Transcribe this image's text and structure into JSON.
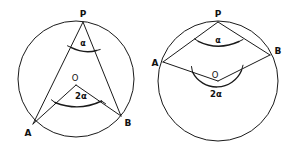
{
  "figure": {
    "background_color": "#ffffff",
    "stroke_color": "#1a1a1a",
    "width": 294,
    "height": 156
  },
  "diagrams": [
    {
      "id": "left-diagram",
      "description": "Inscribed angle alpha at P subtending chord AB, with central angle 2 alpha at O",
      "circle": {
        "cx": 76,
        "cy": 79,
        "r": 58
      },
      "points": [
        {
          "name": "P",
          "label": "P",
          "x": 83,
          "y": 22,
          "label_x": 83,
          "label_y": 14
        },
        {
          "name": "O",
          "label": "O",
          "x": 76,
          "y": 85,
          "label_x": 75,
          "label_y": 79
        },
        {
          "name": "A",
          "label": "A",
          "x": 33,
          "y": 124,
          "label_x": 28,
          "label_y": 133
        },
        {
          "name": "B",
          "label": "B",
          "x": 121,
          "y": 116,
          "label_x": 127,
          "label_y": 123
        }
      ],
      "segments": [
        {
          "name": "chord-PA",
          "from": "P",
          "to": "A"
        },
        {
          "name": "chord-PB",
          "from": "P",
          "to": "B"
        },
        {
          "name": "radius-OA",
          "from": "O",
          "to": "A"
        },
        {
          "name": "radius-OB",
          "from": "O",
          "to": "B"
        }
      ],
      "angles": [
        {
          "name": "inscribed-angle",
          "vertex": "P",
          "label": "α",
          "label_x": 83,
          "label_y": 48,
          "arc_radius": 25,
          "type": "inscribed"
        },
        {
          "name": "central-angle",
          "vertex": "O",
          "label": "2α",
          "label_x": 81,
          "label_y": 99,
          "arc_radius": 27,
          "type": "central"
        }
      ]
    },
    {
      "id": "right-diagram",
      "description": "Inscribed angle alpha at P with reflex central angle 2 alpha at O below the chord AB",
      "circle": {
        "cx": 218,
        "cy": 81,
        "r": 60
      },
      "points": [
        {
          "name": "P",
          "label": "P",
          "x": 218,
          "y": 22,
          "label_x": 218,
          "label_y": 14
        },
        {
          "name": "O",
          "label": "O",
          "x": 218,
          "y": 81,
          "label_x": 215,
          "label_y": 76
        },
        {
          "name": "A",
          "label": "A",
          "x": 163,
          "y": 62,
          "label_x": 156,
          "label_y": 64
        },
        {
          "name": "B",
          "label": "B",
          "x": 270,
          "y": 55,
          "label_x": 277,
          "label_y": 52
        }
      ],
      "segments": [
        {
          "name": "chord-PA",
          "from": "P",
          "to": "A"
        },
        {
          "name": "chord-PB",
          "from": "P",
          "to": "B"
        },
        {
          "name": "chord-AB-left",
          "from": "A",
          "to": "O"
        },
        {
          "name": "chord-AB-right",
          "from": "O",
          "to": "B"
        }
      ],
      "angles": [
        {
          "name": "inscribed-angle",
          "vertex": "P",
          "label": "α",
          "label_x": 218,
          "label_y": 44,
          "arc_radius": 26,
          "type": "inscribed"
        },
        {
          "name": "reflex-central-angle",
          "vertex": "O",
          "label": "2α",
          "label_x": 216,
          "label_y": 96,
          "arc_radius": 26,
          "type": "reflex-central"
        }
      ]
    }
  ]
}
